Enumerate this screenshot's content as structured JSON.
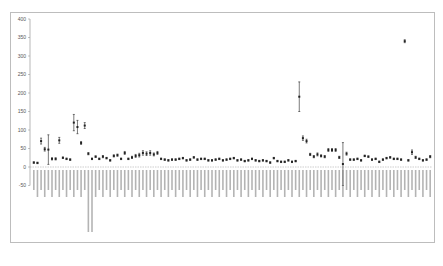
{
  "chart_data": {
    "type": "scatter",
    "subtype": "mean_with_error_bars",
    "title": "",
    "xlabel": "",
    "ylabel": "",
    "ylim": [
      -50,
      400
    ],
    "yticks": [
      400,
      350,
      300,
      250,
      200,
      150,
      100,
      50,
      0,
      -50
    ],
    "grid": false,
    "legend": null,
    "x_label_orientation": "vertical",
    "x_labels_note": "Approximately 100 bacterial taxon names (e.g. Citrobacter, Enterococcus, Lactobacillus, Staphylococcus, Streptococcus); text too small to read individually",
    "categories_count": 100,
    "values": [
      12,
      11,
      70,
      48,
      47,
      22,
      22,
      72,
      25,
      22,
      20,
      120,
      108,
      65,
      112,
      36,
      22,
      28,
      22,
      28,
      24,
      18,
      30,
      32,
      22,
      38,
      22,
      26,
      30,
      32,
      38,
      36,
      38,
      34,
      38,
      22,
      20,
      18,
      20,
      20,
      22,
      24,
      18,
      20,
      26,
      20,
      22,
      22,
      18,
      18,
      20,
      22,
      18,
      20,
      22,
      24,
      18,
      20,
      16,
      18,
      22,
      18,
      16,
      18,
      16,
      12,
      24,
      16,
      14,
      14,
      18,
      14,
      16,
      190,
      78,
      70,
      34,
      28,
      34,
      30,
      28,
      46,
      46,
      46,
      26,
      8,
      36,
      20,
      20,
      22,
      18,
      30,
      28,
      20,
      22,
      14,
      20,
      24,
      26,
      22,
      22,
      20,
      340,
      18,
      40,
      26,
      22,
      18,
      20,
      28
    ],
    "errors": [
      2,
      2,
      8,
      5,
      40,
      3,
      3,
      8,
      2,
      2,
      2,
      22,
      18,
      4,
      8,
      3,
      2,
      2,
      2,
      3,
      2,
      2,
      3,
      3,
      2,
      4,
      2,
      3,
      4,
      5,
      6,
      5,
      6,
      4,
      4,
      2,
      2,
      2,
      2,
      2,
      2,
      2,
      2,
      2,
      2,
      2,
      2,
      2,
      2,
      2,
      2,
      2,
      2,
      2,
      2,
      2,
      2,
      2,
      2,
      2,
      2,
      2,
      2,
      2,
      2,
      2,
      2,
      2,
      2,
      2,
      2,
      2,
      2,
      40,
      6,
      5,
      3,
      3,
      4,
      3,
      3,
      4,
      4,
      4,
      3,
      58,
      4,
      2,
      2,
      2,
      2,
      2,
      2,
      2,
      2,
      2,
      2,
      2,
      2,
      2,
      2,
      2,
      4,
      2,
      6,
      3,
      2,
      2,
      2,
      3
    ]
  },
  "axis": {
    "y_tick_labels": [
      "400",
      "350",
      "300",
      "250",
      "200",
      "150",
      "100",
      "50",
      "0",
      "-50"
    ]
  },
  "colors": {
    "marker": "#222222",
    "axis": "#888888",
    "frame": "#bdbdbd",
    "zero_line": "#999999"
  }
}
